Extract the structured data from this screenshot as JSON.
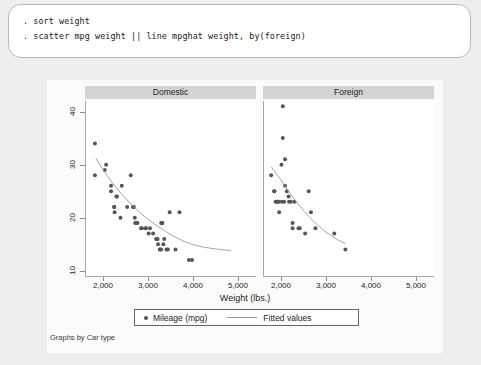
{
  "console": {
    "lines": [
      ". sort weight",
      ". scatter mpg weight || line mpghat weight, by(foreign)"
    ]
  },
  "graph": {
    "note": "Graphs by Car type",
    "legend": {
      "markers_label": "Mileage (mpg)",
      "line_label": "Fitted values"
    }
  },
  "colors": {
    "page_background": "#eeeeee",
    "console_background": "#ffffff",
    "plot_background": "#ffffff",
    "panel_band": "#d4d4d4",
    "marker": "#53565c",
    "fit_line": "#9a9a9a",
    "axis": "#a8a8a8"
  },
  "chart_data": {
    "type": "scatter",
    "title": "",
    "xlabel": "Weight (lbs.)",
    "ylabel": "",
    "xlim": [
      1600,
      5400
    ],
    "ylim": [
      9,
      42
    ],
    "xticks": [
      2000,
      3000,
      4000,
      5000
    ],
    "xtick_labels": [
      "2,000",
      "3,000",
      "4,000",
      "5,000"
    ],
    "yticks": [
      10,
      20,
      30,
      40
    ],
    "ytick_labels": [
      "10",
      "20",
      "30",
      "40"
    ],
    "grid": false,
    "legend_position": "bottom",
    "facet_by": "Car type",
    "panels": [
      {
        "label": "Domestic",
        "series": [
          {
            "name": "Mileage (mpg)",
            "type": "scatter",
            "points": [
              [
                1800,
                34
              ],
              [
                1800,
                28
              ],
              [
                2020,
                29
              ],
              [
                2050,
                30
              ],
              [
                2160,
                26
              ],
              [
                2160,
                25
              ],
              [
                2230,
                22
              ],
              [
                2230,
                22
              ],
              [
                2240,
                21
              ],
              [
                2280,
                24
              ],
              [
                2290,
                24
              ],
              [
                2370,
                20
              ],
              [
                2400,
                26
              ],
              [
                2520,
                22
              ],
              [
                2600,
                28
              ],
              [
                2650,
                22
              ],
              [
                2670,
                22
              ],
              [
                2690,
                20
              ],
              [
                2700,
                19
              ],
              [
                2730,
                19
              ],
              [
                2750,
                19
              ],
              [
                2830,
                18
              ],
              [
                2850,
                18
              ],
              [
                2930,
                18
              ],
              [
                2940,
                18
              ],
              [
                3000,
                17
              ],
              [
                3030,
                18
              ],
              [
                3170,
                16
              ],
              [
                3180,
                16
              ],
              [
                3200,
                16
              ],
              [
                3210,
                15
              ],
              [
                3250,
                14
              ],
              [
                3260,
                14
              ],
              [
                3280,
                14
              ],
              [
                3330,
                15
              ],
              [
                3350,
                16
              ],
              [
                3400,
                14
              ],
              [
                3430,
                14
              ],
              [
                3470,
                21
              ],
              [
                3600,
                14
              ],
              [
                3690,
                21
              ],
              [
                3900,
                12
              ],
              [
                3970,
                12
              ],
              [
                3280,
                19
              ],
              [
                3300,
                19
              ],
              [
                3310,
                19
              ],
              [
                3100,
                17
              ]
            ]
          },
          {
            "name": "Fitted values",
            "type": "line",
            "points": [
              [
                1820,
                31.2
              ],
              [
                2000,
                28.8
              ],
              [
                2200,
                26.4
              ],
              [
                2400,
                24.4
              ],
              [
                2600,
                22.6
              ],
              [
                2800,
                21.0
              ],
              [
                3000,
                19.6
              ],
              [
                3200,
                18.4
              ],
              [
                3400,
                17.3
              ],
              [
                3600,
                16.3
              ],
              [
                3800,
                15.5
              ],
              [
                4000,
                14.9
              ],
              [
                4200,
                14.5
              ],
              [
                4400,
                14.2
              ],
              [
                4600,
                14.0
              ],
              [
                4840,
                13.8
              ]
            ]
          }
        ]
      },
      {
        "label": "Foreign",
        "series": [
          {
            "name": "Mileage (mpg)",
            "type": "scatter",
            "points": [
              [
                2020,
                41
              ],
              [
                2020,
                35
              ],
              [
                1760,
                28
              ],
              [
                1830,
                25
              ],
              [
                1830,
                25
              ],
              [
                1860,
                23
              ],
              [
                1900,
                23
              ],
              [
                1900,
                23
              ],
              [
                1930,
                23
              ],
              [
                1940,
                21
              ],
              [
                1990,
                30
              ],
              [
                2070,
                31
              ],
              [
                2070,
                26
              ],
              [
                2110,
                25
              ],
              [
                2150,
                24
              ],
              [
                2160,
                23
              ],
              [
                2200,
                23
              ],
              [
                2240,
                18
              ],
              [
                2280,
                23
              ],
              [
                2370,
                18
              ],
              [
                2400,
                18
              ],
              [
                2520,
                17
              ],
              [
                2600,
                25
              ],
              [
                2650,
                21
              ],
              [
                2750,
                18
              ],
              [
                3170,
                17
              ],
              [
                3420,
                14
              ],
              [
                2000,
                23
              ],
              [
                2050,
                23
              ],
              [
                2240,
                19
              ]
            ]
          },
          {
            "name": "Fitted values",
            "type": "line",
            "points": [
              [
                1760,
                29.6
              ],
              [
                1900,
                28.0
              ],
              [
                2050,
                26.2
              ],
              [
                2200,
                24.4
              ],
              [
                2350,
                22.7
              ],
              [
                2500,
                21.2
              ],
              [
                2650,
                19.8
              ],
              [
                2800,
                18.6
              ],
              [
                2950,
                17.5
              ],
              [
                3100,
                16.6
              ],
              [
                3250,
                15.8
              ],
              [
                3420,
                15.1
              ]
            ]
          }
        ]
      }
    ]
  }
}
